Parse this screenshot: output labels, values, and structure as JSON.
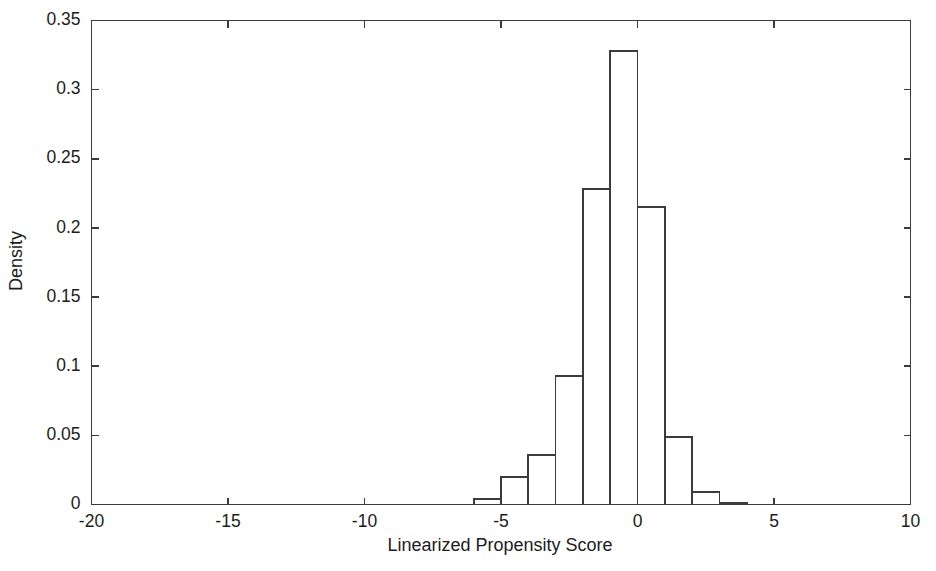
{
  "chart_data": {
    "type": "bar",
    "title": "",
    "subtitle": "",
    "xlabel": "Linearized Propensity Score",
    "ylabel": "Density",
    "xlim": [
      -20,
      10
    ],
    "ylim": [
      0,
      0.35
    ],
    "xticks": [
      -20,
      -15,
      -10,
      -5,
      0,
      5,
      10
    ],
    "xtick_labels": [
      "-20",
      "-15",
      "-10",
      "-5",
      "0",
      "5",
      "10"
    ],
    "yticks": [
      0,
      0.05,
      0.1,
      0.15,
      0.2,
      0.25,
      0.3,
      0.35
    ],
    "ytick_labels": [
      "0",
      "0.05",
      "0.1",
      "0.15",
      "0.2",
      "0.25",
      "0.3",
      "0.35"
    ],
    "grid": false,
    "legend": null,
    "bin_width": 1,
    "bin_edges": [
      -6,
      -5,
      -4,
      -3,
      -2,
      -1,
      0,
      1,
      2,
      3,
      4
    ],
    "categories": [
      "-6 to -5",
      "-5 to -4",
      "-4 to -3",
      "-3 to -2",
      "-2 to -1",
      "-1 to 0",
      "0 to 1",
      "1 to 2",
      "2 to 3",
      "3 to 4"
    ],
    "values": [
      0.004,
      0.02,
      0.036,
      0.093,
      0.228,
      0.328,
      0.215,
      0.049,
      0.009,
      0.001
    ],
    "bar_fill": "#ffffff",
    "bar_stroke": "#3b3b3b",
    "axis_color": "#3b3b3b",
    "background": "#ffffff"
  }
}
